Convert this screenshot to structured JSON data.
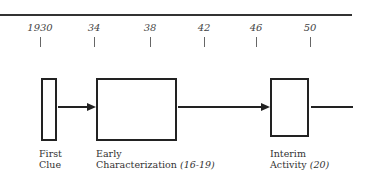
{
  "timeline": {
    "ticks": [
      {
        "label": "1930",
        "x": 40
      },
      {
        "label": "34",
        "x": 94
      },
      {
        "label": "38",
        "x": 150
      },
      {
        "label": "42",
        "x": 204
      },
      {
        "label": "46",
        "x": 256
      },
      {
        "label": "50",
        "x": 310
      }
    ]
  },
  "stages": [
    {
      "line1": "First",
      "line2": "Clue",
      "ref": ""
    },
    {
      "line1": "Early",
      "line2": "Characterization",
      "ref": "(16-19)"
    },
    {
      "line1": "Interim",
      "line2": "Activity",
      "ref": "(20)"
    }
  ]
}
